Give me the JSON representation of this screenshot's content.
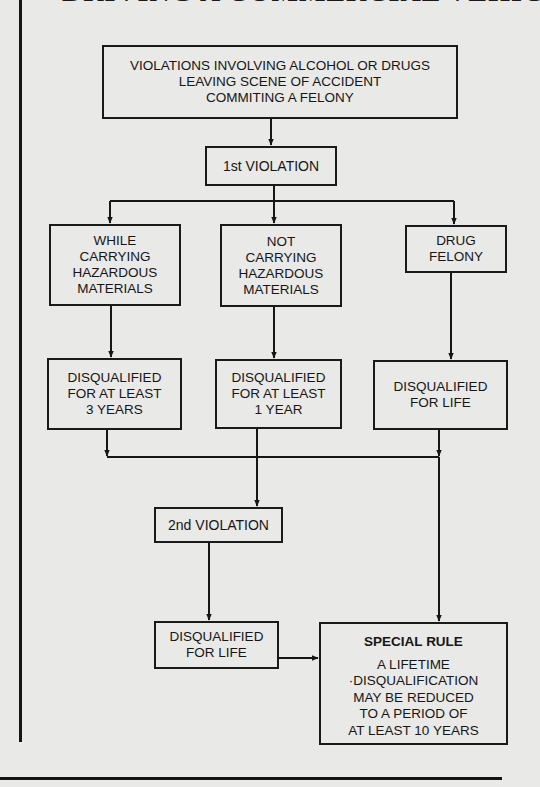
{
  "title": "DRIVING A COMMERCIAL VEHICLE",
  "colors": {
    "background": "#e9e9e7",
    "ink": "#161616"
  },
  "nodes": {
    "offenses": {
      "lines": [
        "VIOLATIONS INVOLVING ALCOHOL OR DRUGS",
        "LEAVING SCENE OF ACCIDENT",
        "COMMITING A FELONY"
      ]
    },
    "first_violation": {
      "label": "1st VIOLATION"
    },
    "hazmat": {
      "lines": [
        "WHILE",
        "CARRYING",
        "HAZARDOUS",
        "MATERIALS"
      ]
    },
    "non_hazmat": {
      "lines": [
        "NOT",
        "CARRYING",
        "HAZARDOUS",
        "MATERIALS"
      ]
    },
    "drug_felony": {
      "lines": [
        "DRUG",
        "FELONY"
      ]
    },
    "dq_3_years": {
      "lines": [
        "DISQUALIFIED",
        "FOR AT LEAST",
        "3 YEARS"
      ]
    },
    "dq_1_year": {
      "lines": [
        "DISQUALIFIED",
        "FOR AT LEAST",
        "1 YEAR"
      ]
    },
    "dq_life_drug": {
      "lines": [
        "DISQUALIFIED",
        "FOR LIFE"
      ]
    },
    "second_violation": {
      "label": "2nd VIOLATION"
    },
    "dq_life_second": {
      "lines": [
        "DISQUALIFIED",
        "FOR LIFE"
      ]
    },
    "special_rule": {
      "heading": "SPECIAL RULE",
      "lines": [
        "A LIFETIME",
        "·DISQUALIFICATION",
        "MAY BE REDUCED",
        "TO A PERIOD OF",
        "AT LEAST 10 YEARS"
      ]
    }
  },
  "edges": [
    [
      "offenses",
      "first_violation"
    ],
    [
      "first_violation",
      "hazmat"
    ],
    [
      "first_violation",
      "non_hazmat"
    ],
    [
      "first_violation",
      "drug_felony"
    ],
    [
      "hazmat",
      "dq_3_years"
    ],
    [
      "non_hazmat",
      "dq_1_year"
    ],
    [
      "drug_felony",
      "dq_life_drug"
    ],
    [
      "dq_3_years",
      "second_violation"
    ],
    [
      "dq_1_year",
      "second_violation"
    ],
    [
      "dq_life_drug",
      "special_rule"
    ],
    [
      "second_violation",
      "dq_life_second"
    ],
    [
      "dq_life_second",
      "special_rule"
    ]
  ]
}
